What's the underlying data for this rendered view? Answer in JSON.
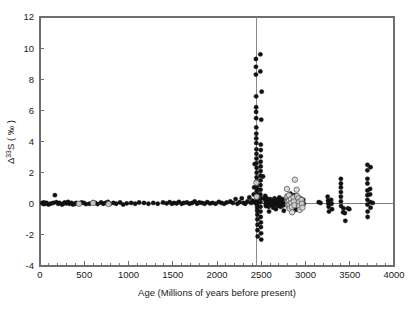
{
  "chart_data": {
    "type": "scatter",
    "title": "",
    "xlabel": "Age (Millions of years before present)",
    "ylabel_parts": {
      "delta": "Δ",
      "mass": "33",
      "element": "S",
      "open_paren": " ( ",
      "permil": "‰",
      "close_paren": " )"
    },
    "ylabel": "Δ33S ( ‰ )",
    "xlim": [
      0,
      4000
    ],
    "ylim": [
      -4,
      12
    ],
    "xticks": [
      0,
      500,
      1000,
      1500,
      2000,
      2500,
      3000,
      3500,
      4000
    ],
    "xtick_labels": [
      "0",
      "500",
      "1000",
      "1500",
      "2000",
      "2500",
      "3000",
      "3500",
      "4000"
    ],
    "xminor_step": 100,
    "yticks": [
      -4,
      -2,
      0,
      2,
      4,
      6,
      8,
      10,
      12
    ],
    "ytick_labels": [
      "-4",
      "-2",
      "0",
      "2",
      "4",
      "6",
      "8",
      "10",
      "12"
    ],
    "grid": false,
    "legend": "none",
    "annotations": [
      {
        "type": "vline",
        "x": 2450,
        "label": "Great Oxidation Event boundary",
        "color": "#8a8a8a"
      },
      {
        "type": "hline",
        "y": 0,
        "label": "zero reference",
        "color": "#6e6e6e"
      }
    ],
    "series": [
      {
        "name": "filled-circles",
        "marker": "filled-circle",
        "color": "#111111",
        "points": [
          [
            25,
            0.05
          ],
          [
            38,
            -0.02
          ],
          [
            45,
            0.08
          ],
          [
            60,
            0.0
          ],
          [
            75,
            0.05
          ],
          [
            95,
            -0.05
          ],
          [
            120,
            0.0
          ],
          [
            150,
            0.05
          ],
          [
            168,
            0.55
          ],
          [
            185,
            0.1
          ],
          [
            205,
            0.0
          ],
          [
            220,
            0.05
          ],
          [
            248,
            -0.05
          ],
          [
            262,
            0.0
          ],
          [
            280,
            0.08
          ],
          [
            300,
            0.02
          ],
          [
            318,
            0.12
          ],
          [
            332,
            0.0
          ],
          [
            355,
            0.05
          ],
          [
            372,
            -0.05
          ],
          [
            395,
            0.0
          ],
          [
            410,
            0.05
          ],
          [
            445,
            0.0
          ],
          [
            470,
            0.08
          ],
          [
            495,
            0.05
          ],
          [
            520,
            -0.02
          ],
          [
            560,
            0.0
          ],
          [
            600,
            0.1
          ],
          [
            625,
            0.05
          ],
          [
            650,
            -0.02
          ],
          [
            690,
            0.08
          ],
          [
            715,
            0.0
          ],
          [
            740,
            0.05
          ],
          [
            768,
            0.12
          ],
          [
            790,
            0.0
          ],
          [
            830,
            0.05
          ],
          [
            860,
            0.0
          ],
          [
            905,
            0.08
          ],
          [
            940,
            -0.05
          ],
          [
            980,
            0.02
          ],
          [
            1030,
            0.05
          ],
          [
            1075,
            0.0
          ],
          [
            1120,
            0.08
          ],
          [
            1175,
            0.05
          ],
          [
            1225,
            0.0
          ],
          [
            1280,
            0.05
          ],
          [
            1330,
            0.0
          ],
          [
            1390,
            0.08
          ],
          [
            1430,
            0.02
          ],
          [
            1465,
            0.1
          ],
          [
            1490,
            0.0
          ],
          [
            1515,
            0.05
          ],
          [
            1545,
            0.02
          ],
          [
            1570,
            0.12
          ],
          [
            1600,
            0.0
          ],
          [
            1625,
            0.05
          ],
          [
            1660,
            0.08
          ],
          [
            1690,
            0.0
          ],
          [
            1720,
            0.05
          ],
          [
            1748,
            0.15
          ],
          [
            1775,
            0.0
          ],
          [
            1800,
            0.08
          ],
          [
            1830,
            0.05
          ],
          [
            1860,
            0.0
          ],
          [
            1890,
            0.1
          ],
          [
            1920,
            0.02
          ],
          [
            1950,
            0.05
          ],
          [
            1985,
            0.0
          ],
          [
            2020,
            0.12
          ],
          [
            2050,
            0.05
          ],
          [
            2080,
            0.0
          ],
          [
            2110,
            0.08
          ],
          [
            2150,
            0.15
          ],
          [
            2180,
            0.05
          ],
          [
            2210,
            0.3
          ],
          [
            2230,
            0.0
          ],
          [
            2255,
            0.1
          ],
          [
            2280,
            0.35
          ],
          [
            2300,
            0.05
          ],
          [
            2320,
            0.0
          ],
          [
            2345,
            0.15
          ],
          [
            2365,
            0.4
          ],
          [
            2385,
            0.05
          ],
          [
            2400,
            0.2
          ],
          [
            2415,
            0.6
          ],
          [
            2425,
            0.1
          ],
          [
            2435,
            0.05
          ],
          [
            2440,
            9.3
          ],
          [
            2440,
            8.8
          ],
          [
            2440,
            8.3
          ],
          [
            2442,
            6.9
          ],
          [
            2442,
            6.2
          ],
          [
            2442,
            5.9
          ],
          [
            2442,
            5.5
          ],
          [
            2444,
            4.9
          ],
          [
            2444,
            4.5
          ],
          [
            2444,
            4.2
          ],
          [
            2444,
            3.9
          ],
          [
            2446,
            3.5
          ],
          [
            2446,
            3.2
          ],
          [
            2446,
            2.9
          ],
          [
            2446,
            2.6
          ],
          [
            2448,
            2.3
          ],
          [
            2448,
            2.0
          ],
          [
            2448,
            1.7
          ],
          [
            2448,
            1.45
          ],
          [
            2450,
            1.2
          ],
          [
            2450,
            1.0
          ],
          [
            2450,
            0.8
          ],
          [
            2450,
            0.6
          ],
          [
            2452,
            0.45
          ],
          [
            2452,
            0.3
          ],
          [
            2452,
            0.15
          ],
          [
            2452,
            0.05
          ],
          [
            2454,
            -0.1
          ],
          [
            2454,
            -0.25
          ],
          [
            2454,
            -0.45
          ],
          [
            2456,
            -0.7
          ],
          [
            2456,
            -1.0
          ],
          [
            2458,
            -1.35
          ],
          [
            2458,
            -1.7
          ],
          [
            2460,
            -2.1
          ],
          [
            2425,
            2.55
          ],
          [
            2420,
            1.05
          ],
          [
            2490,
            9.6
          ],
          [
            2490,
            8.5
          ],
          [
            2505,
            7.2
          ],
          [
            2500,
            5.4
          ],
          [
            2495,
            3.8
          ],
          [
            2495,
            3.45
          ],
          [
            2495,
            3.05
          ],
          [
            2493,
            2.7
          ],
          [
            2493,
            2.4
          ],
          [
            2493,
            2.1
          ],
          [
            2493,
            1.8
          ],
          [
            2492,
            1.5
          ],
          [
            2492,
            1.2
          ],
          [
            2492,
            0.9
          ],
          [
            2490,
            0.6
          ],
          [
            2490,
            0.35
          ],
          [
            2490,
            0.1
          ],
          [
            2492,
            -0.2
          ],
          [
            2492,
            -0.5
          ],
          [
            2494,
            -0.85
          ],
          [
            2496,
            -1.2
          ],
          [
            2496,
            -1.5
          ],
          [
            2498,
            -1.9
          ],
          [
            2500,
            -2.3
          ],
          [
            2520,
            1.75
          ],
          [
            2520,
            0.35
          ],
          [
            2545,
            0.5
          ],
          [
            2548,
            0.2
          ],
          [
            2550,
            0.0
          ],
          [
            2552,
            -0.15
          ],
          [
            2560,
            0.35
          ],
          [
            2562,
            0.1
          ],
          [
            2565,
            -0.1
          ],
          [
            2580,
            0.25
          ],
          [
            2582,
            0.05
          ],
          [
            2585,
            -0.2
          ],
          [
            2588,
            -0.5
          ],
          [
            2600,
            0.3
          ],
          [
            2605,
            0.1
          ],
          [
            2610,
            -0.05
          ],
          [
            2625,
            0.2
          ],
          [
            2630,
            0.0
          ],
          [
            2635,
            -0.25
          ],
          [
            2650,
            0.35
          ],
          [
            2655,
            0.15
          ],
          [
            2660,
            -0.05
          ],
          [
            2665,
            -0.35
          ],
          [
            2680,
            0.25
          ],
          [
            2685,
            0.05
          ],
          [
            2690,
            -0.15
          ],
          [
            2705,
            0.4
          ],
          [
            2710,
            0.2
          ],
          [
            2715,
            0.0
          ],
          [
            2720,
            -0.2
          ],
          [
            2740,
            0.3
          ],
          [
            2745,
            0.1
          ],
          [
            2750,
            -0.1
          ],
          [
            2755,
            -0.45
          ],
          [
            2790,
            0.5
          ],
          [
            2795,
            0.25
          ],
          [
            2800,
            0.05
          ],
          [
            2805,
            -0.2
          ],
          [
            2830,
            0.65
          ],
          [
            2835,
            0.4
          ],
          [
            2840,
            0.2
          ],
          [
            2845,
            0.0
          ],
          [
            2848,
            -0.25
          ],
          [
            2870,
            0.55
          ],
          [
            2875,
            0.3
          ],
          [
            2880,
            0.1
          ],
          [
            2885,
            -0.15
          ],
          [
            2890,
            -0.4
          ],
          [
            2910,
            0.45
          ],
          [
            2915,
            0.2
          ],
          [
            2920,
            0.0
          ],
          [
            2925,
            -0.3
          ],
          [
            2945,
            0.35
          ],
          [
            2950,
            0.1
          ],
          [
            2955,
            -0.15
          ],
          [
            2975,
            0.25
          ],
          [
            2980,
            0.0
          ],
          [
            3150,
            0.1
          ],
          [
            3170,
            0.05
          ],
          [
            3250,
            0.45
          ],
          [
            3255,
            0.2
          ],
          [
            3258,
            0.0
          ],
          [
            3262,
            -0.2
          ],
          [
            3265,
            -0.5
          ],
          [
            3290,
            0.25
          ],
          [
            3295,
            0.0
          ],
          [
            3300,
            -0.35
          ],
          [
            3400,
            1.6
          ],
          [
            3400,
            1.3
          ],
          [
            3400,
            1.05
          ],
          [
            3400,
            0.75
          ],
          [
            3400,
            0.45
          ],
          [
            3400,
            0.15
          ],
          [
            3402,
            -0.15
          ],
          [
            3425,
            -0.55
          ],
          [
            3430,
            -0.3
          ],
          [
            3445,
            -0.6
          ],
          [
            3450,
            -1.1
          ],
          [
            3480,
            -0.3
          ],
          [
            3495,
            -0.35
          ],
          [
            3700,
            2.5
          ],
          [
            3700,
            2.15
          ],
          [
            3700,
            1.6
          ],
          [
            3700,
            1.3
          ],
          [
            3700,
            0.85
          ],
          [
            3700,
            0.55
          ],
          [
            3700,
            0.25
          ],
          [
            3700,
            -0.05
          ],
          [
            3702,
            -0.5
          ],
          [
            3702,
            -0.85
          ],
          [
            3735,
            2.35
          ],
          [
            3730,
            0.95
          ],
          [
            3730,
            0.6
          ],
          [
            3732,
            0.1
          ],
          [
            3735,
            -0.25
          ],
          [
            3760,
            0.05
          ]
        ]
      },
      {
        "name": "open-circles",
        "marker": "open-circle",
        "color": "#d8d8d8",
        "points": [
          [
            440,
            0.0
          ],
          [
            600,
            0.05
          ],
          [
            775,
            -0.02
          ],
          [
            2445,
            1.35
          ],
          [
            2448,
            0.45
          ],
          [
            2790,
            0.95
          ],
          [
            2795,
            0.45
          ],
          [
            2800,
            0.15
          ],
          [
            2805,
            -0.1
          ],
          [
            2812,
            0.55
          ],
          [
            2815,
            0.2
          ],
          [
            2818,
            -0.05
          ],
          [
            2820,
            -0.3
          ],
          [
            2835,
            0.3
          ],
          [
            2840,
            0.05
          ],
          [
            2845,
            -0.2
          ],
          [
            2848,
            -0.55
          ],
          [
            2865,
            0.4
          ],
          [
            2870,
            0.15
          ],
          [
            2875,
            -0.1
          ],
          [
            2900,
            0.9
          ],
          [
            2905,
            0.5
          ],
          [
            2920,
            0.35
          ],
          [
            2925,
            0.1
          ],
          [
            2930,
            -0.15
          ],
          [
            2935,
            -0.4
          ],
          [
            2955,
            0.25
          ],
          [
            2960,
            0.0
          ],
          [
            2965,
            -0.25
          ],
          [
            2880,
            1.55
          ]
        ]
      }
    ]
  },
  "axes_geometry": {
    "left_px": 40,
    "right_px": 394,
    "top_px": 17,
    "bottom_px": 266
  }
}
